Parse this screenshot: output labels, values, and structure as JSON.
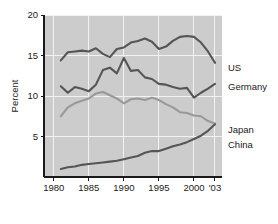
{
  "chart_data": {
    "type": "line",
    "title": "",
    "subtitle": "",
    "xlabel": "",
    "ylabel": "Percent",
    "xlim": [
      1978.6,
      2004.0
    ],
    "ylim": [
      0,
      20
    ],
    "grid": true,
    "legend_position": "right-inline",
    "xticks": [
      1980,
      1985,
      1990,
      1995,
      2000,
      2003
    ],
    "xtick_labels": [
      "1980",
      "1985",
      "1990",
      "1995",
      "2000",
      "'03"
    ],
    "yticks": [
      5,
      10,
      15,
      20
    ],
    "ytick_labels": [
      "5",
      "10",
      "15",
      "20"
    ],
    "x": [
      1981,
      1982,
      1983,
      1984,
      1985,
      1986,
      1987,
      1988,
      1989,
      1990,
      1991,
      1992,
      1993,
      1994,
      1995,
      1996,
      1997,
      1998,
      1999,
      2000,
      2001,
      2002,
      2003
    ],
    "series": [
      {
        "name": "US",
        "color": "#555555",
        "values": [
          14.4,
          15.4,
          15.5,
          15.6,
          15.5,
          15.9,
          15.2,
          14.8,
          15.8,
          16.0,
          16.6,
          16.8,
          17.1,
          16.7,
          15.8,
          16.1,
          16.8,
          17.3,
          17.4,
          17.3,
          16.6,
          15.5,
          14.1
        ]
      },
      {
        "name": "Germany",
        "color": "#555555",
        "values": [
          11.2,
          10.4,
          11.1,
          10.9,
          10.6,
          11.4,
          13.2,
          13.5,
          12.8,
          14.7,
          13.1,
          13.2,
          12.3,
          12.1,
          11.5,
          11.4,
          11.1,
          10.9,
          11.0,
          9.8,
          10.4,
          10.9,
          11.5
        ]
      },
      {
        "name": "Japan",
        "color": "#999999",
        "values": [
          7.5,
          8.6,
          9.1,
          9.4,
          9.7,
          10.3,
          10.5,
          10.1,
          9.7,
          9.1,
          9.6,
          9.7,
          9.5,
          9.8,
          9.5,
          9.0,
          8.6,
          8.0,
          7.9,
          7.6,
          7.5,
          6.9,
          6.6
        ]
      },
      {
        "name": "China",
        "color": "#555555",
        "values": [
          1.0,
          1.2,
          1.3,
          1.5,
          1.6,
          1.7,
          1.8,
          1.9,
          2.0,
          2.2,
          2.4,
          2.6,
          3.0,
          3.2,
          3.2,
          3.5,
          3.8,
          4.0,
          4.3,
          4.7,
          5.1,
          5.7,
          6.5
        ]
      }
    ],
    "annotations": [
      {
        "text": "US",
        "series": "US"
      },
      {
        "text": "Germany",
        "series": "Germany"
      },
      {
        "text": "Japan",
        "series": "Japan"
      },
      {
        "text": "China",
        "series": "China"
      }
    ]
  }
}
